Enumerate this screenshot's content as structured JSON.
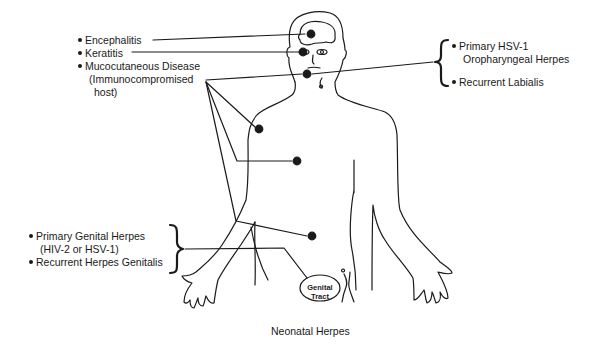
{
  "left_labels": {
    "encephalitis": "Encephalitis",
    "keratitis": "Keratitis",
    "mucocutaneous_line1": "Mucocutaneous Disease",
    "mucocutaneous_line2": "(Immunocompromised",
    "mucocutaneous_line3": "host)"
  },
  "right_labels": {
    "primary_hsv1_line1": "Primary HSV-1",
    "primary_hsv1_line2": "Oropharyngeal Herpes",
    "recurrent_labialis": "Recurrent Labialis"
  },
  "genital_labels": {
    "primary_genital_line1": "Primary Genital Herpes",
    "primary_genital_line2": "(HIV-2 or HSV-1)",
    "recurrent_genitalis": "Recurrent Herpes Genitalis"
  },
  "genital_tract": {
    "line1": "Genital",
    "line2": "Tract"
  },
  "caption": "Neonatal Herpes",
  "colors": {
    "ink": "#1a1a1a",
    "background": "#ffffff"
  }
}
